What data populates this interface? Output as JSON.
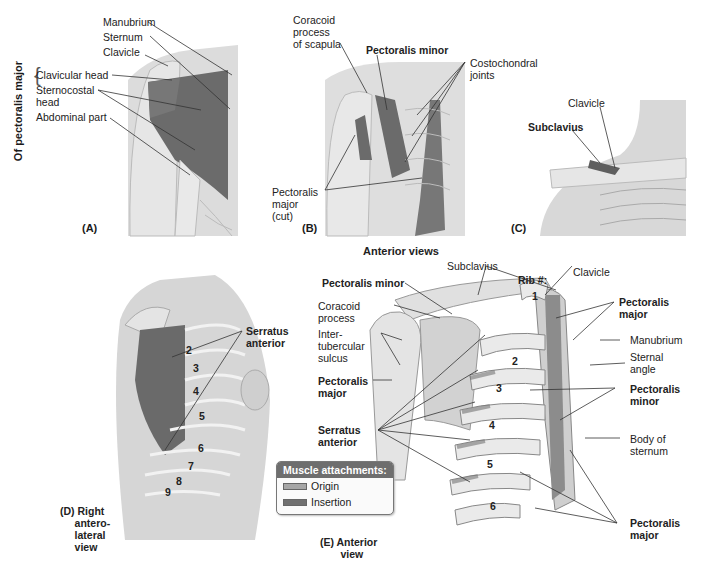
{
  "figure": {
    "shared_caption": "Anterior views",
    "legend": {
      "title": "Muscle attachments:",
      "items": [
        {
          "label": "Origin",
          "color": "#a6a6a6"
        },
        {
          "label": "Insertion",
          "color": "#707070"
        }
      ]
    },
    "colors": {
      "muscle": "#6b6b6b",
      "bone": "#e2e2e2",
      "skin": "#d4d4d4",
      "leader": "#333333"
    },
    "panels": {
      "A": {
        "letter": "(A)",
        "group_label": "Of pectoralis major",
        "labels": {
          "manubrium": "Manubrium",
          "sternum": "Sternum",
          "clavicle": "Clavicle",
          "clavicular_head": "Clavicular head",
          "sternocostal_head": "Sternocostal\nhead",
          "abdominal_part": "Abdominal part"
        }
      },
      "B": {
        "letter": "(B)",
        "labels": {
          "coracoid": "Coracoid\nprocess\nof scapula",
          "pectoralis_minor": "Pectoralis minor",
          "costochondral": "Costochondral\njoints",
          "pectoralis_major_cut": "Pectoralis\nmajor\n(cut)"
        }
      },
      "C": {
        "letter": "(C)",
        "labels": {
          "clavicle": "Clavicle",
          "subclavius": "Subclavius"
        }
      },
      "D": {
        "caption": "(D) Right\n     antero-\n     lateral\n     view",
        "labels": {
          "serratus_anterior": "Serratus\nanterior"
        },
        "rib_numbers": [
          "2",
          "3",
          "4",
          "5",
          "6",
          "7",
          "8",
          "9"
        ]
      },
      "E": {
        "caption": "(E) Anterior\n       view",
        "labels": {
          "pectoralis_minor_top": "Pectoralis minor",
          "subclavius": "Subclavius",
          "rib_heading": "Rib #:",
          "clavicle": "Clavicle",
          "coracoid": "Coracoid\nprocess",
          "intertubercular": "Inter-\ntubercular\nsulcus",
          "pectoralis_major_left": "Pectoralis\nmajor",
          "serratus_anterior": "Serratus\nanterior",
          "pectoralis_major_right_top": "Pectoralis\nmajor",
          "manubrium": "Manubrium",
          "sternal_angle": "Sternal\nangle",
          "pectoralis_minor_right": "Pectoralis\nminor",
          "body_of_sternum": "Body of\nsternum",
          "pectoralis_major_right_bottom": "Pectoralis\nmajor"
        },
        "rib_numbers": [
          "1",
          "2",
          "3",
          "4",
          "5",
          "6"
        ]
      }
    }
  }
}
